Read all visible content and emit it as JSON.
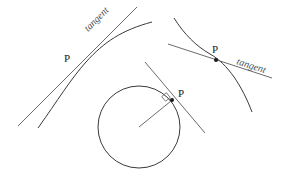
{
  "figure": {
    "background_color": "#ffffff",
    "curve_color": "#3a3a3a",
    "tangent_color": "#6b6b6b",
    "label_color": "#1a1a1a"
  },
  "panels": {
    "left_curve": {
      "point_label": "P",
      "tangent_label": "tangent"
    },
    "right_curve": {
      "point_label": "P",
      "tangent_label": "tangent"
    },
    "circle": {
      "point_label": "P"
    }
  }
}
